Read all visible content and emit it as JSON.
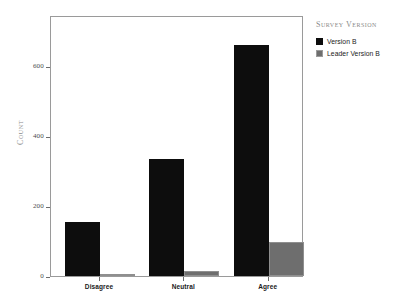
{
  "chart_data": {
    "type": "bar",
    "title": "",
    "xlabel": "",
    "ylabel": "COUNT",
    "categories": [
      "Disagree",
      "Neutral",
      "Agree"
    ],
    "series": [
      {
        "name": "Version B",
        "color": "#0d0d0d",
        "values": [
          154,
          335,
          660
        ]
      },
      {
        "name": "Leader Version B",
        "color": "#6e6e6e",
        "values": [
          2,
          14,
          97
        ]
      }
    ],
    "ylim": [
      0,
      746
    ],
    "yticks": [
      0,
      200,
      400,
      600
    ],
    "ytick_labels": [
      "0",
      "200",
      "400",
      "600"
    ],
    "grid": false,
    "legend": {
      "title": "Survey Version",
      "position": "right"
    }
  },
  "legend": {
    "title": "Survey Version",
    "items": [
      {
        "label": "Version B",
        "swatch": "black-swatch"
      },
      {
        "label": "Leader Version B",
        "swatch": "gray-swatch"
      }
    ]
  },
  "axes": {
    "y_title": "Count",
    "y_ticks": [
      "0",
      "200",
      "400",
      "600"
    ],
    "x_ticks": [
      "Disagree",
      "Neutral",
      "Agree"
    ]
  }
}
